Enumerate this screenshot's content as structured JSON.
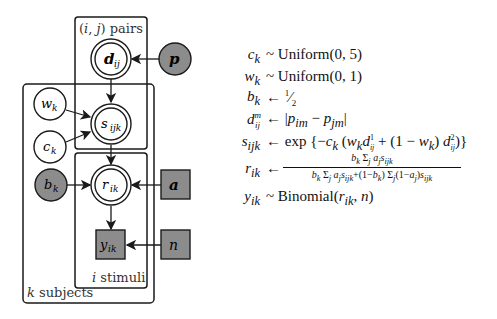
{
  "diagram": {
    "type": "graphical-model",
    "plates": {
      "pairs": "(i, j) pairs",
      "subjects": "k subjects",
      "stimuli": "i stimuli"
    },
    "nodes": {
      "d": {
        "label": "d",
        "sub": "ij",
        "kind": "deterministic",
        "bold": true
      },
      "p": {
        "label": "p",
        "kind": "observed",
        "bold": true
      },
      "w": {
        "label": "w",
        "sub": "k",
        "kind": "latent"
      },
      "c": {
        "label": "c",
        "sub": "k",
        "kind": "latent"
      },
      "s": {
        "label": "s",
        "sub": "ijk",
        "kind": "deterministic"
      },
      "b": {
        "label": "b",
        "sub": "k",
        "kind": "observed"
      },
      "r": {
        "label": "r",
        "sub": "ik",
        "kind": "deterministic"
      },
      "a": {
        "label": "a",
        "kind": "observed-discrete",
        "bold": true
      },
      "y": {
        "label": "y",
        "sub": "ik",
        "kind": "observed-discrete"
      },
      "n": {
        "label": "n",
        "kind": "observed-discrete"
      }
    },
    "edges": [
      [
        "p",
        "d"
      ],
      [
        "d",
        "s"
      ],
      [
        "w",
        "s"
      ],
      [
        "c",
        "s"
      ],
      [
        "s",
        "r"
      ],
      [
        "b",
        "r"
      ],
      [
        "a",
        "r"
      ],
      [
        "r",
        "y"
      ],
      [
        "n",
        "y"
      ]
    ],
    "colors": {
      "filled": "#8c8c8c",
      "stroke": "#1a1a1a"
    }
  },
  "equations": [
    {
      "lhs": "c_k",
      "rel": "~",
      "rhs": "Uniform(0, 5)"
    },
    {
      "lhs": "w_k",
      "rel": "~",
      "rhs": "Uniform(0, 1)"
    },
    {
      "lhs": "b_k",
      "rel": "←",
      "rhs": "1/2"
    },
    {
      "lhs": "d_ij^m",
      "rel": "←",
      "rhs": "|p_im − p_jm|"
    },
    {
      "lhs": "s_ijk",
      "rel": "←",
      "rhs": "exp{−c_k (w_k d_ij^1 + (1 − w_k) d_ij^2)}"
    },
    {
      "lhs": "r_ik",
      "rel": "←",
      "rhs": "b_k Σ_j a_j s_ijk / (b_k Σ_j a_j s_ijk + (1−b_k) Σ_j (1−a_j) s_ijk)"
    },
    {
      "lhs": "y_ik",
      "rel": "~",
      "rhs": "Binomial(r_ik, n)"
    }
  ]
}
